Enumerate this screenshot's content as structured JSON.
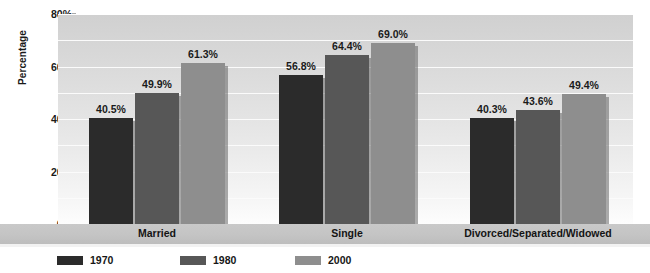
{
  "chart_data": {
    "type": "bar",
    "title": "",
    "xlabel": "",
    "ylabel": "Percentage",
    "categories": [
      "Married",
      "Single",
      "Divorced/Separated/Widowed"
    ],
    "series": [
      {
        "name": "1970",
        "color": "#2b2b2b",
        "values": [
          40.5,
          56.8,
          40.3
        ],
        "labels": [
          "40.5%",
          "56.8%",
          "40.3%"
        ]
      },
      {
        "name": "1980",
        "color": "#575757",
        "values": [
          49.9,
          64.4,
          43.6
        ],
        "labels": [
          "49.9%",
          "64.4%",
          "43.6%"
        ]
      },
      {
        "name": "2000",
        "color": "#8e8e8e",
        "values": [
          61.3,
          69.0,
          49.4
        ],
        "labels": [
          "61.3%",
          "69.0%",
          "49.4%"
        ]
      }
    ],
    "ylim": [
      0,
      80
    ],
    "ytick_values": [
      0,
      20,
      40,
      60,
      80
    ],
    "ytick_labels": [
      "0%",
      "20%",
      "40%",
      "60%",
      "80%"
    ],
    "gridline_values": [
      10,
      20,
      30,
      40,
      50,
      60,
      70
    ],
    "grid": true,
    "legend_position": "bottom"
  },
  "legend": {
    "entries": [
      {
        "label": "1970",
        "color": "#2b2b2b"
      },
      {
        "label": "1980",
        "color": "#575757"
      },
      {
        "label": "2000",
        "color": "#8e8e8e"
      }
    ]
  }
}
